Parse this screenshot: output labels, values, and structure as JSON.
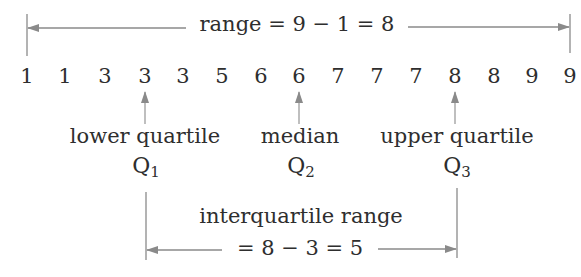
{
  "range": {
    "label": "range = 9 − 1 = 8",
    "min": 1,
    "max": 9,
    "value": 8
  },
  "data_values": [
    {
      "label": "1",
      "x": 27
    },
    {
      "label": "1",
      "x": 65
    },
    {
      "label": "3",
      "x": 105
    },
    {
      "label": "3",
      "x": 145
    },
    {
      "label": "3",
      "x": 183
    },
    {
      "label": "5",
      "x": 222
    },
    {
      "label": "6",
      "x": 261
    },
    {
      "label": "6",
      "x": 299
    },
    {
      "label": "7",
      "x": 338
    },
    {
      "label": "7",
      "x": 377
    },
    {
      "label": "7",
      "x": 416
    },
    {
      "label": "8",
      "x": 455
    },
    {
      "label": "8",
      "x": 494
    },
    {
      "label": "9",
      "x": 532
    },
    {
      "label": "9",
      "x": 570
    }
  ],
  "markers": {
    "lower_quartile": {
      "label": "lower quartile",
      "symbol": "Q",
      "sub": "1",
      "value": 3
    },
    "median": {
      "label": "median",
      "symbol": "Q",
      "sub": "2",
      "value": 6
    },
    "upper_quartile": {
      "label": "upper quartile",
      "symbol": "Q",
      "sub": "3",
      "value": 8
    }
  },
  "interquartile_range": {
    "label_line1": "interquartile range",
    "label_line2": "= 8 − 3 = 5",
    "value": 5
  },
  "colors": {
    "text": "#2e2e2e",
    "lines": "#8a8a8a"
  }
}
